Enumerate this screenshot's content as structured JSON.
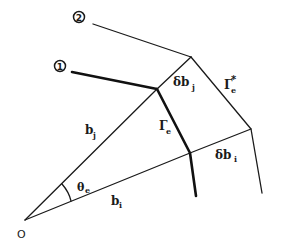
{
  "diagram": {
    "origin_label": "O",
    "interface_labels": {
      "first": "1",
      "second": "2"
    },
    "segments": {
      "b_j": {
        "base": "b",
        "sub": "j"
      },
      "b_i": {
        "base": "b",
        "sub": "i"
      },
      "delta_b_j": {
        "base": "δb",
        "sub": "j"
      },
      "delta_b_i": {
        "base": "δb",
        "sub": "i"
      },
      "gamma_e": {
        "base": "Γ",
        "sub": "e"
      },
      "gamma_e_star": {
        "base": "Γ",
        "sub": "e",
        "sup": "*"
      },
      "theta_e": {
        "base": "θ",
        "sub": "e"
      }
    }
  }
}
